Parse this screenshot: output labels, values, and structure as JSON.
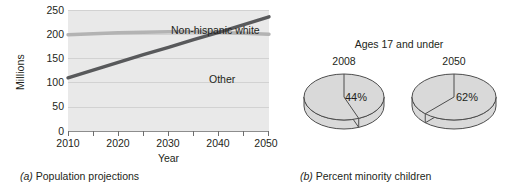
{
  "figure": {
    "panel_a": {
      "caption_marker": "(a)",
      "caption_text": "Population projections",
      "ylabel": "Millions",
      "xlabel": "Year",
      "series_labels": {
        "white": "Non-hispanic white",
        "other": "Other"
      }
    },
    "panel_b": {
      "caption_marker": "(b)",
      "caption_text": "Percent minority children",
      "title": "Ages 17 and under"
    }
  },
  "colors": {
    "plot_background": "#e9e9e9",
    "gridline": "#d2d2d2",
    "axis": "#8d8d8d",
    "series_other": "#58595b",
    "series_white": "#b3b3b3",
    "pie_fill": "#d9d9d9",
    "pie_edge": "#4d4d4d",
    "text": "#231f20"
  },
  "chart_data": [
    {
      "id": "population-projections",
      "type": "line",
      "title": "",
      "xlabel": "Year",
      "ylabel": "Millions",
      "xlim": [
        2010,
        2050
      ],
      "ylim": [
        0,
        250
      ],
      "xticks": [
        2010,
        2015,
        2020,
        2025,
        2030,
        2035,
        2040,
        2045,
        2050
      ],
      "xtick_labels": [
        "2010",
        "",
        "2020",
        "",
        "2030",
        "",
        "2040",
        "",
        "2050"
      ],
      "yticks": [
        0,
        50,
        100,
        150,
        200,
        250
      ],
      "ytick_labels": [
        "0",
        "50",
        "100",
        "150",
        "200",
        "250"
      ],
      "grid": "horizontal",
      "legend": "inline-annotations",
      "series": [
        {
          "name": "Non-hispanic white",
          "color": "#b3b3b3",
          "x": [
            2010,
            2015,
            2020,
            2025,
            2030,
            2035,
            2040,
            2045,
            2050
          ],
          "values": [
            199,
            201,
            203,
            204,
            205,
            205,
            204,
            202,
            200
          ]
        },
        {
          "name": "Other",
          "color": "#58595b",
          "x": [
            2010,
            2015,
            2020,
            2025,
            2030,
            2035,
            2040,
            2045,
            2050
          ],
          "values": [
            110,
            126,
            142,
            158,
            173,
            189,
            204,
            220,
            236
          ]
        }
      ]
    },
    {
      "id": "percent-minority-children-2008",
      "type": "pie",
      "title": "2008",
      "supertitle": "Ages 17 and under",
      "labels": [
        "Minority",
        "Non-minority"
      ],
      "values": [
        44,
        56
      ],
      "value_labels": [
        "44%",
        ""
      ],
      "colors": [
        "#d9d9d9",
        "#d9d9d9"
      ]
    },
    {
      "id": "percent-minority-children-2050",
      "type": "pie",
      "title": "2050",
      "supertitle": "Ages 17 and under",
      "labels": [
        "Minority",
        "Non-minority"
      ],
      "values": [
        62,
        38
      ],
      "value_labels": [
        "62%",
        ""
      ],
      "colors": [
        "#d9d9d9",
        "#d9d9d9"
      ]
    }
  ]
}
